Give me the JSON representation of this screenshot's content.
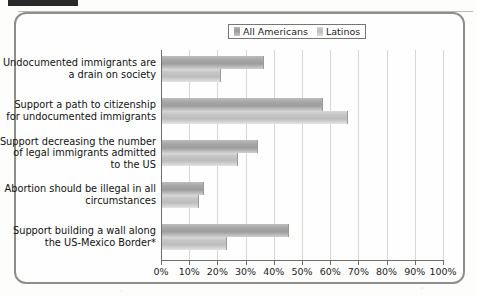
{
  "figure": {
    "frame_color": "#8e8e8a",
    "background": "#fefefe"
  },
  "legend": {
    "position": "top-right",
    "entries": [
      {
        "label": "All Americans",
        "swatch": "legend-swatch-all-americans",
        "color": "#a6a6a6"
      },
      {
        "label": "Latinos",
        "swatch": "legend-swatch-latinos",
        "color": "#c4c4c4"
      }
    ]
  },
  "axis": {
    "tick_labels": [
      "0%",
      "10%",
      "20%",
      "30%",
      "40%",
      "50%",
      "60%",
      "70%",
      "80%",
      "90%",
      "100%"
    ],
    "min": 0,
    "max": 100
  },
  "chart_data": {
    "type": "bar",
    "orientation": "horizontal",
    "title": "",
    "subtitle": "",
    "xlabel": "",
    "ylabel": "",
    "xlim": [
      0,
      100
    ],
    "grid": true,
    "grid_axis": "x",
    "legend_position": "top-right",
    "categories": [
      "Undocumented immigrants are\na drain on society",
      "Support a path to citizenship\nfor undocumented immigrants",
      "Support decreasing the number\nof legal immigrants admitted\nto the US",
      "Abortion should be illegal in all\ncircumstances",
      "Support building a wall along\nthe US-Mexico Border*"
    ],
    "series": [
      {
        "name": "All Americans",
        "values": [
          36,
          57,
          34,
          15,
          45
        ]
      },
      {
        "name": "Latinos",
        "values": [
          21,
          66,
          27,
          13,
          23
        ]
      }
    ],
    "annotations": [
      "* footnote marker on last category label"
    ]
  }
}
